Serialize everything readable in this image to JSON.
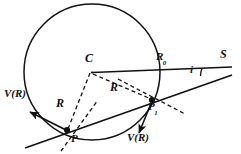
{
  "figure": {
    "type": "geometry-diagram",
    "background_color": "#ffffff",
    "stroke_color": "#111111",
    "labels": {
      "center": "C",
      "source": "S",
      "radius_outer": "R",
      "radius_outer_sub": "0",
      "radius_left": "R",
      "radius_right": "R",
      "point_p": "P",
      "point_p1": "P",
      "point_p1_sub": "1",
      "angle": "i",
      "velocity_left": "V(R)",
      "velocity_right": "V(R)"
    },
    "geometry": {
      "circle": {
        "cx": 92,
        "cy": 72,
        "r": 68
      },
      "center_point": {
        "x": 92,
        "y": 72
      },
      "source_point": {
        "x": 224,
        "y": 67
      },
      "point_p": {
        "x": 67,
        "y": 130
      },
      "point_p1": {
        "x": 152,
        "y": 100
      },
      "axis_line": {
        "x1": 92,
        "y1": 72,
        "x2": 231,
        "y2": 67
      },
      "ray_line": {
        "x1": 26,
        "y1": 147,
        "x2": 231,
        "y2": 75
      },
      "dashed_radius_p": {
        "x1": 92,
        "y1": 72,
        "x2": 67,
        "y2": 130
      },
      "dashed_radius_p1": {
        "x1": 92,
        "y1": 72,
        "x2": 152,
        "y2": 100
      },
      "dashed_normal_p": {
        "x1": 60,
        "y1": 148,
        "x2": 99,
        "y2": 105
      },
      "dashed_normal_p1": {
        "x1": 120,
        "y1": 80,
        "x2": 183,
        "y2": 113
      },
      "arrow_v_left": {
        "x1": 67,
        "y1": 130,
        "x2": 27,
        "y2": 110
      },
      "arrow_v_right": {
        "x1": 152,
        "y1": 100,
        "x2": 137,
        "y2": 136
      },
      "angle_arc_at_source": {
        "radius": 23
      }
    },
    "label_positions": {
      "center": {
        "x": 85,
        "y": 58
      },
      "source": {
        "x": 220,
        "y": 54
      },
      "radius_outer": {
        "x": 155,
        "y": 52
      },
      "radius_left": {
        "x": 57,
        "y": 99
      },
      "radius_right": {
        "x": 110,
        "y": 85
      },
      "point_p": {
        "x": 69,
        "y": 135
      },
      "point_p1": {
        "x": 148,
        "y": 105
      },
      "angle": {
        "x": 189,
        "y": 68
      },
      "velocity_left": {
        "x": 5,
        "y": 94
      },
      "velocity_right": {
        "x": 128,
        "y": 135
      }
    }
  }
}
